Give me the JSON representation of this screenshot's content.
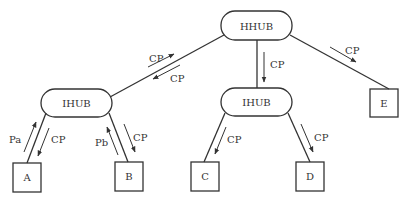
{
  "diagram": {
    "type": "network-hierarchy",
    "nodes": {
      "hhub": {
        "label": "HHUB",
        "shape": "rounded-rect"
      },
      "ihub_left": {
        "label": "IHUB",
        "shape": "rounded-rect"
      },
      "ihub_mid": {
        "label": "IHUB",
        "shape": "rounded-rect"
      },
      "a": {
        "label": "A",
        "shape": "square"
      },
      "b": {
        "label": "B",
        "shape": "square"
      },
      "c": {
        "label": "C",
        "shape": "square"
      },
      "d": {
        "label": "D",
        "shape": "square"
      },
      "e": {
        "label": "E",
        "shape": "square"
      }
    },
    "edges": [
      {
        "from": "HHUB",
        "to": "IHUB (left)",
        "messages": [
          {
            "label": "CP",
            "direction": "to HHUB"
          },
          {
            "label": "CP",
            "direction": "to IHUB"
          }
        ]
      },
      {
        "from": "HHUB",
        "to": "IHUB (middle)",
        "messages": [
          {
            "label": "CP",
            "direction": "to IHUB"
          }
        ]
      },
      {
        "from": "HHUB",
        "to": "E",
        "messages": [
          {
            "label": "CP",
            "direction": "to E"
          }
        ]
      },
      {
        "from": "IHUB (left)",
        "to": "A",
        "messages": [
          {
            "label": "Pa",
            "direction": "to IHUB"
          },
          {
            "label": "CP",
            "direction": "to A"
          }
        ]
      },
      {
        "from": "IHUB (left)",
        "to": "B",
        "messages": [
          {
            "label": "Pb",
            "direction": "to IHUB"
          },
          {
            "label": "CP",
            "direction": "to B"
          }
        ]
      },
      {
        "from": "IHUB (middle)",
        "to": "C",
        "messages": [
          {
            "label": "CP",
            "direction": "to C"
          }
        ]
      },
      {
        "from": "IHUB (middle)",
        "to": "D",
        "messages": [
          {
            "label": "CP",
            "direction": "to D"
          }
        ]
      }
    ],
    "labels": {
      "hhub_ihubl_up": "CP",
      "hhub_ihubl_down": "CP",
      "hhub_ihubm": "CP",
      "hhub_e": "CP",
      "ihubl_a_up": "Pa",
      "ihubl_a_down": "CP",
      "ihubl_b_up": "Pb",
      "ihubl_b_down": "CP",
      "ihubm_c": "CP",
      "ihubm_d": "CP"
    },
    "colors": {
      "stroke": "#333333",
      "background": "#ffffff"
    }
  }
}
